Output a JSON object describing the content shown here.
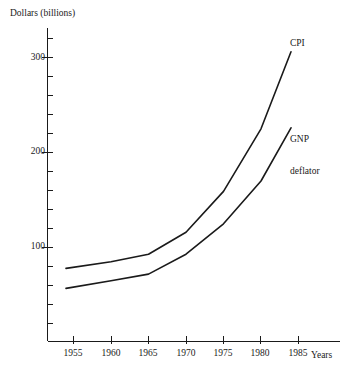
{
  "chart_data": {
    "type": "line",
    "title": "",
    "subtitle": "",
    "xlabel": "Years",
    "ylabel": "Dollars (billions)",
    "xlim": [
      1952.5,
      1987.5
    ],
    "ylim": [
      0,
      330
    ],
    "grid": false,
    "legend_position": "inline-right-end-labels",
    "x_ticks": [
      1955,
      1960,
      1965,
      1970,
      1975,
      1980,
      1985
    ],
    "x_tick_labels": [
      "1955",
      "1960",
      "1965",
      "1970",
      "1975",
      "1980",
      "1985"
    ],
    "y_ticks": [
      100,
      200,
      300
    ],
    "y_tick_labels": [
      "100",
      "200",
      "300"
    ],
    "y_minor_tick_step": 20,
    "series": [
      {
        "name": "CPI",
        "label_lines": [
          "CPI"
        ],
        "x": [
          1954,
          1960,
          1965,
          1970,
          1975,
          1980,
          1984
        ],
        "values": [
          78,
          85,
          93,
          116,
          159,
          225,
          306
        ]
      },
      {
        "name": "GNP deflator",
        "label_lines": [
          "GNP",
          "deflator"
        ],
        "x": [
          1954,
          1960,
          1965,
          1970,
          1975,
          1980,
          1984
        ],
        "values": [
          57,
          65,
          72,
          93,
          125,
          170,
          226
        ]
      }
    ],
    "line_color": "#1a1a1a",
    "axis_color": "#1a1a1a",
    "background_color": "#ffffff"
  },
  "axes": {
    "y_title": "Dollars (billions)",
    "x_title": "Years",
    "y_labels": {
      "t300": "300",
      "t200": "200",
      "t100": "100"
    },
    "x_labels": {
      "y1955": "1955",
      "y1960": "1960",
      "y1965": "1965",
      "y1970": "1970",
      "y1975": "1975",
      "y1980": "1980",
      "y1985": "1985"
    }
  },
  "annotations": {
    "cpi": "CPI",
    "gnp_line1": "GNP",
    "gnp_line2": "deflator"
  }
}
